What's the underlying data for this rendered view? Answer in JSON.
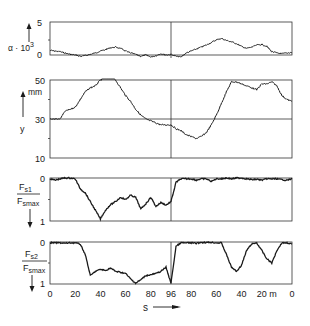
{
  "chart_data": {
    "type": "line",
    "x_axis": {
      "label": "s",
      "unit": "m",
      "tick_labels": [
        "0",
        "20",
        "40",
        "60",
        "80",
        "96",
        "80",
        "60",
        "40",
        "20 m",
        "0"
      ],
      "segments": [
        {
          "from": 0,
          "to": 96,
          "direction": "forward"
        },
        {
          "from": 96,
          "to": 0,
          "direction": "reverse"
        }
      ],
      "divider_at": 96
    },
    "x": [
      0,
      4,
      8,
      12,
      16,
      20,
      24,
      28,
      32,
      36,
      40,
      44,
      48,
      52,
      56,
      60,
      64,
      68,
      72,
      76,
      80,
      84,
      88,
      92,
      96,
      100,
      104,
      108,
      112,
      116,
      120,
      124,
      128,
      132,
      136,
      140,
      144,
      148,
      152,
      156,
      160,
      164,
      168,
      172,
      176,
      180,
      184,
      188,
      192
    ],
    "x_note": "x is cumulative path position (0-192); 96-192 corresponds to s = 96 back to 0",
    "panels": [
      {
        "id": "alpha",
        "ylabel": "α · 10³",
        "ylabel_base": "α · 10",
        "ylabel_sup": "3",
        "y_ticks": [
          "0",
          "5"
        ],
        "ylim": [
          0,
          5
        ],
        "values": [
          0.7,
          0.6,
          0.5,
          0.3,
          0.1,
          0.0,
          -0.2,
          -0.1,
          0.1,
          0.3,
          0.6,
          0.8,
          1.1,
          1.2,
          1.0,
          0.6,
          0.3,
          0.1,
          -0.2,
          0.0,
          -0.3,
          -0.1,
          0.2,
          0.0,
          0.1,
          -0.2,
          -0.3,
          0.3,
          0.6,
          0.9,
          1.2,
          1.5,
          1.9,
          2.3,
          2.5,
          2.2,
          2.0,
          1.7,
          1.3,
          1.0,
          1.2,
          1.5,
          1.6,
          1.3,
          0.5,
          0.3,
          0.2,
          0.3,
          0.4
        ]
      },
      {
        "id": "y",
        "ylabel": "y",
        "unit": "mm",
        "y_ticks": [
          "10",
          "30",
          "50"
        ],
        "y_minor_ticks": [
          20,
          40
        ],
        "reference_line": 30,
        "ylim": [
          10,
          50
        ],
        "values": [
          30,
          30,
          30,
          34,
          35,
          36,
          40,
          44,
          46,
          47,
          50,
          51,
          52,
          50,
          46,
          42,
          39,
          35,
          32,
          30,
          29,
          28,
          27,
          27,
          27,
          25,
          24,
          22,
          21,
          20,
          21,
          23,
          27,
          32,
          38,
          44,
          49,
          49,
          48,
          47,
          46,
          45,
          48,
          48,
          49,
          47,
          42,
          40,
          39
        ]
      },
      {
        "id": "Fs1",
        "ylabel_num": "Fs1",
        "ylabel_den": "Fsmax",
        "y_ticks": [
          "0",
          "1"
        ],
        "y_minor_ticks": [
          0.5
        ],
        "ylim": [
          0,
          1
        ],
        "inverted": true,
        "values": [
          0.02,
          0.05,
          0.02,
          0.0,
          0.0,
          0.02,
          0.25,
          0.35,
          0.55,
          0.75,
          0.95,
          0.75,
          0.62,
          0.55,
          0.45,
          0.5,
          0.4,
          0.45,
          0.72,
          0.6,
          0.45,
          0.66,
          0.57,
          0.63,
          0.55,
          0.1,
          0.02,
          0.02,
          0.02,
          0.05,
          0.02,
          0.02,
          0.08,
          0.02,
          0.02,
          0.0,
          0.02,
          0.0,
          0.0,
          0.02,
          0.04,
          0.03,
          0.05,
          0.02,
          0.02,
          0.02,
          0.04,
          0.05,
          0.02
        ]
      },
      {
        "id": "Fs2",
        "ylabel_num": "Fs2",
        "ylabel_den": "Fsmax",
        "y_ticks": [
          "0",
          "1"
        ],
        "y_minor_ticks": [
          0.5
        ],
        "ylim": [
          0,
          1
        ],
        "inverted": true,
        "values": [
          0.02,
          0.02,
          0.02,
          0.03,
          0.02,
          0.02,
          0.05,
          0.3,
          0.8,
          0.7,
          0.65,
          0.68,
          0.62,
          0.7,
          0.72,
          0.75,
          0.88,
          0.98,
          0.9,
          0.8,
          0.78,
          0.75,
          0.7,
          0.6,
          0.98,
          0.1,
          0.02,
          0.02,
          0.02,
          0.03,
          0.01,
          0.01,
          0.01,
          0.02,
          0.02,
          0.3,
          0.6,
          0.7,
          0.55,
          0.2,
          0.05,
          0.02,
          0.2,
          0.4,
          0.5,
          0.2,
          0.02,
          0.02,
          0.05
        ]
      }
    ],
    "legend": null,
    "grid": false
  },
  "labels": {
    "alpha": {
      "base": "α · 10",
      "sup": "3",
      "tick_top": "5",
      "tick_bottom": "0"
    },
    "y": {
      "unit": "mm",
      "name": "y",
      "tick_50": "50",
      "tick_30": "30",
      "tick_10": "10"
    },
    "fs1": {
      "num": "F",
      "num_sub": "s1",
      "den": "F",
      "den_sub": "smax",
      "tick_top": "0",
      "tick_bottom": "1"
    },
    "fs2": {
      "num": "F",
      "num_sub": "s2",
      "den": "F",
      "den_sub": "smax",
      "tick_top": "0",
      "tick_bottom": "1"
    },
    "xaxis": {
      "name": "s"
    }
  },
  "style": {
    "line_color": "#1a1a1a",
    "frame_color": "#333333",
    "background": "#ffffff"
  }
}
